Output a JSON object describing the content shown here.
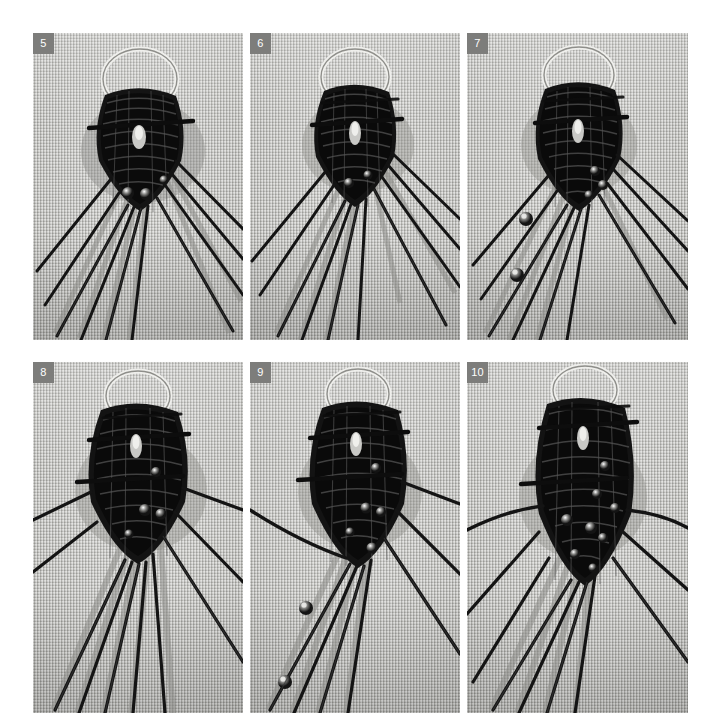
{
  "page": {
    "layout": "2 rows x 3 columns photo grid",
    "background_color": "#ffffff",
    "width": 713,
    "height": 719
  },
  "style": {
    "badge_background": "#7d7d7b",
    "badge_text_color": "#ffffff",
    "fabric_color": "#b3b3af",
    "cord_color": "#1d1d1d",
    "ring_color": "#e8e8e6",
    "bead_highlight": "#f2f2f0"
  },
  "panels": [
    {
      "id": "panel-5",
      "badge": "5",
      "row": 1,
      "column": 1,
      "subject": "black macrame knotted medallion on metal ring with crossed pins and fanned cords",
      "elements": {
        "ring": true,
        "pins": 1,
        "bead_count": 3,
        "cord_fan_left": 5,
        "cord_fan_right": 5,
        "loose_beads_on_cords": 0
      }
    },
    {
      "id": "panel-6",
      "badge": "6",
      "row": 1,
      "column": 2,
      "subject": "knotted medallion with additional row of knots, cords fanned downward",
      "elements": {
        "ring": true,
        "pins": 2,
        "bead_count": 2,
        "cord_fan_left": 5,
        "cord_fan_right": 5,
        "loose_beads_on_cords": 0
      }
    },
    {
      "id": "panel-7",
      "badge": "7",
      "row": 1,
      "column": 3,
      "subject": "medallion with two beads threaded onto left working cords",
      "elements": {
        "ring": true,
        "pins": 2,
        "bead_count": 5,
        "cord_fan_left": 5,
        "cord_fan_right": 5,
        "loose_beads_on_cords": 2
      }
    },
    {
      "id": "panel-8",
      "badge": "8",
      "row": 2,
      "column": 1,
      "subject": "enlarged medallion, cords spread wide to both sides, several beads set in knots",
      "elements": {
        "ring": true,
        "pins": 3,
        "bead_count": 4,
        "cord_fan_left": 6,
        "cord_fan_right": 4,
        "loose_beads_on_cords": 0
      }
    },
    {
      "id": "panel-9",
      "badge": "9",
      "row": 2,
      "column": 2,
      "subject": "medallion with long diagonal cord sweeping left and two beads strung on cords",
      "elements": {
        "ring": true,
        "pins": 3,
        "bead_count": 5,
        "cord_fan_left": 5,
        "cord_fan_right": 3,
        "loose_beads_on_cords": 2
      }
    },
    {
      "id": "panel-10",
      "badge": "10",
      "row": 2,
      "column": 3,
      "subject": "completed oval medallion with beads worked in, cords radiating outward",
      "elements": {
        "ring": true,
        "pins": 3,
        "bead_count": 8,
        "cord_fan_left": 5,
        "cord_fan_right": 4,
        "loose_beads_on_cords": 0
      }
    }
  ]
}
